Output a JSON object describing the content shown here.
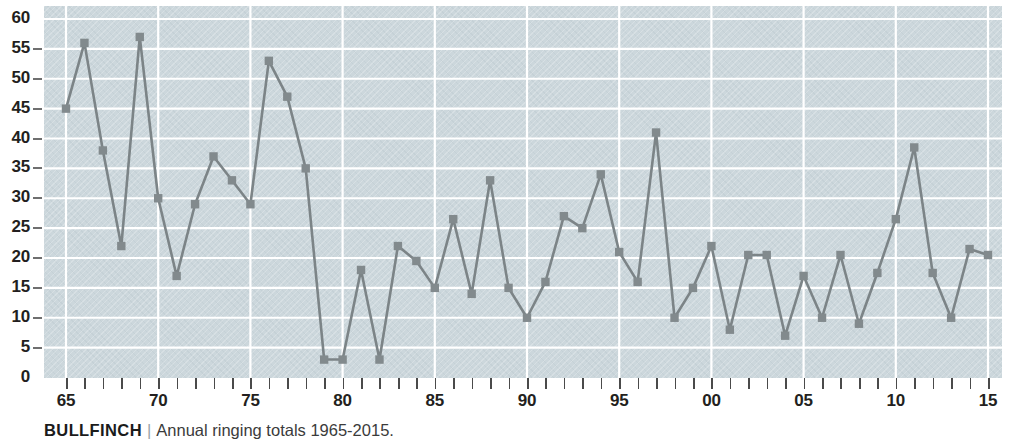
{
  "caption": {
    "species": "BULLFINCH",
    "separator": "|",
    "text": "Annual ringing totals 1965-2015."
  },
  "colors": {
    "plot_background": "#ccd7dc",
    "gridline": "#ffffff",
    "series_line": "#7c8487",
    "marker": "#828a8d",
    "axis_text": "#231f20",
    "tick": "#4a4a4a"
  },
  "chart_data": {
    "type": "line",
    "title": "BULLFINCH",
    "subtitle": "Annual ringing totals 1965-2015.",
    "xlabel": "",
    "ylabel": "",
    "ylim": [
      0,
      60
    ],
    "y_ticks": [
      0,
      5,
      10,
      15,
      20,
      25,
      30,
      35,
      40,
      45,
      50,
      55,
      60
    ],
    "xlim": [
      1965,
      2015
    ],
    "x_tick_labels": [
      "65",
      "70",
      "75",
      "80",
      "85",
      "90",
      "95",
      "00",
      "05",
      "10",
      "15"
    ],
    "x_tick_years": [
      1965,
      1970,
      1975,
      1980,
      1985,
      1990,
      1995,
      2000,
      2005,
      2010,
      2015
    ],
    "x_minor_tick_step": 1,
    "grid": true,
    "legend": "none",
    "marker": "square",
    "x": [
      1965,
      1966,
      1967,
      1968,
      1969,
      1970,
      1971,
      1972,
      1973,
      1974,
      1975,
      1976,
      1977,
      1978,
      1979,
      1980,
      1981,
      1982,
      1983,
      1984,
      1985,
      1986,
      1987,
      1988,
      1989,
      1990,
      1991,
      1992,
      1993,
      1994,
      1995,
      1996,
      1997,
      1998,
      1999,
      2000,
      2001,
      2002,
      2003,
      2004,
      2005,
      2006,
      2007,
      2008,
      2009,
      2010,
      2011,
      2012,
      2013,
      2014,
      2015
    ],
    "values": [
      45,
      56,
      38,
      22,
      57,
      30,
      17,
      29,
      37,
      33,
      29,
      53,
      47,
      35,
      3,
      3,
      18,
      3,
      22,
      19.5,
      15,
      26.5,
      14,
      33,
      15,
      10,
      16,
      27,
      25,
      34,
      21,
      16,
      41,
      10,
      15,
      22,
      8,
      20.5,
      20.5,
      7,
      17,
      10,
      20.5,
      9,
      17.5,
      26.5,
      38.5,
      17.5,
      10,
      21.5,
      20.5
    ]
  }
}
